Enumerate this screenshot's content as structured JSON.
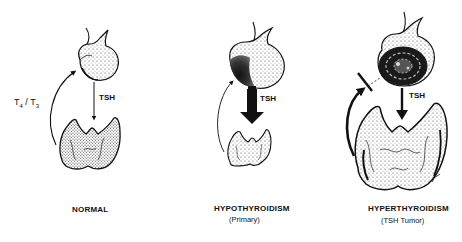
{
  "panels": [
    {
      "id": "normal",
      "title": "NORMAL",
      "subtitle": "",
      "arrow_label": "TSH",
      "feedback_label": {
        "t4": "T",
        "t4_sub": "4",
        "sep": " / ",
        "t3": "T",
        "t3_sub": "3"
      },
      "tsh_arrow": "thin",
      "feedback": "normal",
      "pituitary": "normal",
      "thyroid": "normal"
    },
    {
      "id": "hypothyroidism",
      "title": "HYPOTHYROIDISM",
      "subtitle": "(Primary)",
      "arrow_label": "TSH",
      "tsh_arrow": "thick",
      "feedback": "weak",
      "pituitary": "enlarged-dark",
      "thyroid": "small"
    },
    {
      "id": "hyperthyroidism",
      "title": "HYPERTHYROIDISM",
      "subtitle": "(TSH Tumor)",
      "arrow_label": "TSH",
      "tsh_arrow": "medium",
      "feedback": "blocked",
      "pituitary": "tumor",
      "thyroid": "enlarged"
    }
  ],
  "colors": {
    "ink": "#111111",
    "background": "#ffffff",
    "stipple": "#555555"
  }
}
